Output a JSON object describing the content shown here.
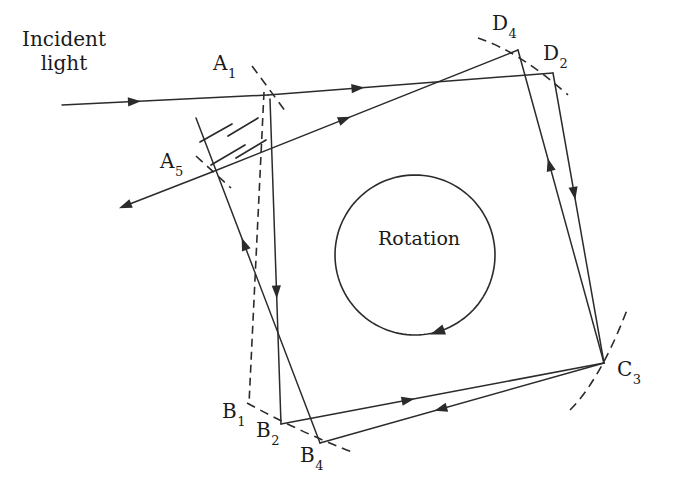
{
  "figure": {
    "type": "optical-ray-diagram",
    "background_color": "#ffffff",
    "line_color": "#2b2b2b",
    "text_color": "#1a1a1a"
  },
  "annotations": {
    "incident_light": {
      "line1": "Incident",
      "line2": "light"
    },
    "rotation": "Rotation"
  },
  "vertices": [
    {
      "id": "A1",
      "letter": "A",
      "sub": "1",
      "x": 213,
      "y": 52,
      "label_x": 213,
      "label_y": 52
    },
    {
      "id": "A5",
      "letter": "A",
      "sub": "5",
      "x": 160,
      "y": 150,
      "label_x": 160,
      "label_y": 150
    },
    {
      "id": "B1",
      "letter": "B",
      "sub": "1",
      "x": 222,
      "y": 400,
      "label_x": 222,
      "label_y": 400
    },
    {
      "id": "B2",
      "letter": "B",
      "sub": "2",
      "x": 256,
      "y": 419,
      "label_x": 256,
      "label_y": 419
    },
    {
      "id": "B4",
      "letter": "B",
      "sub": "4",
      "x": 300,
      "y": 444,
      "label_x": 300,
      "label_y": 444
    },
    {
      "id": "C3",
      "letter": "C",
      "sub": "3",
      "x": 617,
      "y": 358,
      "label_x": 617,
      "label_y": 358
    },
    {
      "id": "D2",
      "letter": "D",
      "sub": "2",
      "x": 543,
      "y": 42,
      "label_x": 543,
      "label_y": 42
    },
    {
      "id": "D4",
      "letter": "D",
      "sub": "4",
      "x": 492,
      "y": 12,
      "label_x": 492,
      "label_y": 12
    }
  ],
  "geometry": {
    "corner_points": {
      "A1": [
        268,
        95
      ],
      "A5": [
        212,
        172
      ],
      "B1": [
        249,
        404
      ],
      "B2": [
        281,
        424
      ],
      "B4": [
        320,
        443
      ],
      "C3": [
        604,
        363
      ],
      "D2": [
        553,
        73
      ],
      "D4": [
        518,
        50
      ]
    },
    "rays": [
      {
        "name": "incident-ray",
        "from": [
          62,
          105
        ],
        "to": [
          268,
          95
        ],
        "arrow_at": 0.33,
        "direction": "forward"
      },
      {
        "name": "top-edge-ray-A1-D2",
        "from": [
          268,
          95
        ],
        "to": [
          553,
          73
        ],
        "arrow_at": 0.3,
        "direction": "forward"
      },
      {
        "name": "diagonal-ray-D4-A5",
        "from": [
          518,
          50
        ],
        "to": [
          212,
          172
        ],
        "arrow_at": 0.58,
        "direction": "reverse"
      },
      {
        "name": "exit-ray-A5",
        "from": [
          212,
          172
        ],
        "to": [
          122,
          207
        ],
        "arrow_at": 0.92,
        "direction": "forward"
      },
      {
        "name": "left-edge-ray-A1-B2",
        "from": [
          270,
          99
        ],
        "to": [
          281,
          424
        ],
        "arrow_at": 0.58,
        "direction": "forward"
      },
      {
        "name": "left-edge-ray-B4-A5up",
        "from": [
          320,
          443
        ],
        "to": [
          196,
          118
        ],
        "arrow_at": 0.6,
        "direction": "forward"
      },
      {
        "name": "bottom-edge-ray-B2-C3",
        "from": [
          281,
          424
        ],
        "to": [
          604,
          363
        ],
        "arrow_at": 0.38,
        "direction": "forward"
      },
      {
        "name": "bottom-edge-ray-C3-B4",
        "from": [
          604,
          363
        ],
        "to": [
          320,
          443
        ],
        "arrow_at": 0.56,
        "direction": "forward"
      },
      {
        "name": "right-edge-ray-C3-D4",
        "from": [
          604,
          363
        ],
        "to": [
          518,
          50
        ],
        "arrow_at": 0.62,
        "direction": "forward"
      },
      {
        "name": "right-edge-ray-D2-C3",
        "from": [
          553,
          73
        ],
        "to": [
          604,
          363
        ],
        "arrow_at": 0.4,
        "direction": "forward"
      }
    ],
    "dashed_lines": [
      {
        "name": "dashed-edge-A1-B1",
        "from": [
          264,
          92
        ],
        "to": [
          249,
          404
        ]
      }
    ],
    "dashed_arcs": [
      {
        "name": "arc-at-A1",
        "d": "M 252 66 L 286 112"
      },
      {
        "name": "arc-at-A5",
        "d": "M 196 156 L 231 188"
      },
      {
        "name": "arc-D4",
        "d": "M 478 38 Q 520 52 568 95"
      },
      {
        "name": "arc-C3",
        "d": "M 570 410 Q 600 380 627 310"
      },
      {
        "name": "arc-B4",
        "d": "M 247 403 Q 300 432 352 452"
      }
    ],
    "hatching": [
      {
        "from": [
          200,
          142
        ],
        "to": [
          232,
          124
        ]
      },
      {
        "from": [
          211,
          165
        ],
        "to": [
          245,
          145
        ]
      },
      {
        "from": [
          228,
          136
        ],
        "to": [
          258,
          118
        ]
      },
      {
        "from": [
          236,
          158
        ],
        "to": [
          266,
          140
        ]
      }
    ],
    "rotation_arc": {
      "name": "rotation-arrow",
      "cx": 415,
      "cy": 255,
      "r": 80,
      "direction": "counter-clockwise",
      "arrow_point": [
        347,
        305
      ]
    }
  }
}
